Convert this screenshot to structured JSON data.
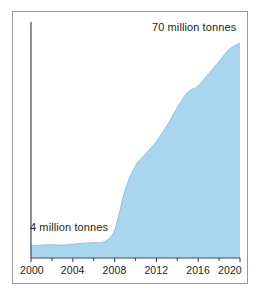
{
  "chart_data": {
    "type": "area",
    "title": "",
    "subtitle": "",
    "xlabel": "",
    "ylabel": "",
    "xlim": [
      2000,
      2020
    ],
    "ylim": [
      0,
      75
    ],
    "grid": false,
    "legend": "none",
    "series": [
      {
        "name": "Production",
        "units": "million tonnes",
        "fill_color": "#a9d6ef",
        "line_color": "#8cc4e2",
        "x": [
          2000,
          2001,
          2002,
          2003,
          2004,
          2005,
          2006,
          2007,
          2008,
          2009,
          2010,
          2011,
          2012,
          2013,
          2014,
          2015,
          2016,
          2017,
          2018,
          2019,
          2020
        ],
        "values": [
          4,
          4.2,
          4.3,
          4.2,
          4.5,
          4.8,
          5.0,
          5.3,
          9,
          22,
          30,
          34,
          38,
          43,
          49,
          54,
          56,
          60,
          64,
          68,
          70
        ]
      }
    ],
    "x_ticks": [
      2000,
      2004,
      2008,
      2012,
      2016,
      2020
    ],
    "x_tick_labels": [
      "2000",
      "2004",
      "2008",
      "2012",
      "2016",
      "2020"
    ],
    "x_minor_ticks": [
      2002,
      2006,
      2010,
      2014,
      2018
    ],
    "y_ticks": [],
    "y_tick_labels": [],
    "annotations": [
      {
        "id": "peak-label",
        "text": "70 million tonnes",
        "x": 2020,
        "y": 70,
        "position": "top-right"
      },
      {
        "id": "start-label",
        "text": "4 million tonnes",
        "x": 2000,
        "y": 4,
        "position": "bottom-left"
      }
    ],
    "colors": {
      "area_fill": "#a9d6ef",
      "axis": "#3b4a5a",
      "frame": "#9a9a9a",
      "text": "#231f20",
      "background": "#ffffff"
    }
  },
  "axis": {
    "x_tick_labels": [
      "2000",
      "2004",
      "2008",
      "2012",
      "2016",
      "2020"
    ]
  },
  "labels": {
    "peak": "70 million tonnes",
    "start": "4 million tonnes"
  }
}
